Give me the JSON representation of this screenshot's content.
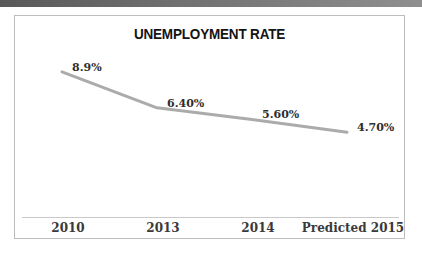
{
  "chart": {
    "title": "UNEMPLOYMENT RATE"
  },
  "chart_data": {
    "type": "line",
    "title": "UNEMPLOYMENT RATE",
    "categories": [
      "2010",
      "2013",
      "2014",
      "Predicted 2015"
    ],
    "values": [
      8.9,
      6.4,
      5.6,
      4.7
    ],
    "labels": [
      "8.9%",
      "6.40%",
      "5.60%",
      "4.70%"
    ],
    "xlabel": "",
    "ylabel": "",
    "legend": "none",
    "gridlines": false,
    "value_axis": "hidden",
    "line_color": "#ababab",
    "line_width": 3
  }
}
